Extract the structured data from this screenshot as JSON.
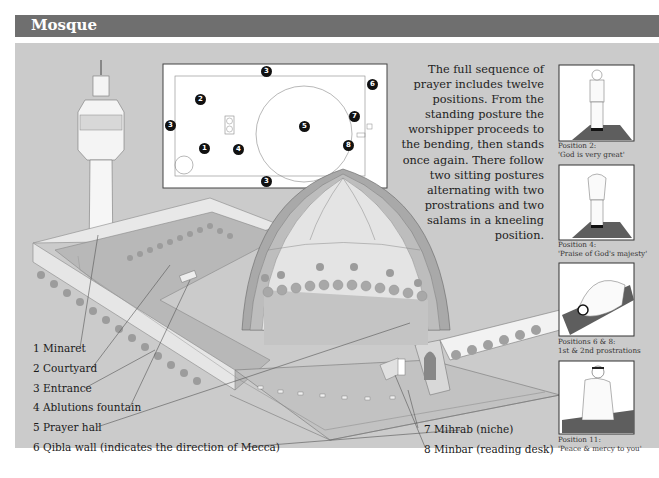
{
  "header": {
    "title": "Mosque"
  },
  "intro_text": "The full sequence of prayer includes twelve positions. From the standing posture the worshipper proceeds to the bending, then stands once again. There follow two sitting postures alternating with two prostrations and two salams in a kneeling position.",
  "legend": [
    {
      "num": "1",
      "label": "1 Minaret"
    },
    {
      "num": "2",
      "label": "2 Courtyard"
    },
    {
      "num": "3",
      "label": "3 Entrance"
    },
    {
      "num": "4",
      "label": "4 Ablutions fountain"
    },
    {
      "num": "5",
      "label": "5 Prayer hall"
    },
    {
      "num": "6",
      "label": "6 Qibla wall (indicates the direction of Mecca)"
    },
    {
      "num": "7",
      "label": "7 Mihrab (niche)"
    },
    {
      "num": "8",
      "label": "8 Minbar (reading desk)"
    }
  ],
  "plan_markers": [
    {
      "label": "3",
      "x": 266,
      "y": 71
    },
    {
      "label": "6",
      "x": 372,
      "y": 84
    },
    {
      "label": "2",
      "x": 200,
      "y": 99
    },
    {
      "label": "3",
      "x": 170,
      "y": 125
    },
    {
      "label": "5",
      "x": 304,
      "y": 126
    },
    {
      "label": "7",
      "x": 354,
      "y": 116
    },
    {
      "label": "1",
      "x": 204,
      "y": 148
    },
    {
      "label": "4",
      "x": 238,
      "y": 149
    },
    {
      "label": "8",
      "x": 348,
      "y": 145
    },
    {
      "label": "3",
      "x": 266,
      "y": 181
    }
  ],
  "positions": [
    {
      "caption_line1": "Position 2:",
      "caption_line2": "'God is very great'"
    },
    {
      "caption_line1": "Position 4:",
      "caption_line2": "'Praise of God's majesty'"
    },
    {
      "caption_line1": "Positions 6 & 8:",
      "caption_line2": "1st & 2nd prostrations"
    },
    {
      "caption_line1": "Position 11:",
      "caption_line2": "'Peace & mercy to you'"
    }
  ],
  "colors": {
    "header_bg": "#6f6f6f",
    "panel_bg": "#cbcbcb",
    "marker": "#111111",
    "prayer_mat": "#5e5e5e"
  }
}
